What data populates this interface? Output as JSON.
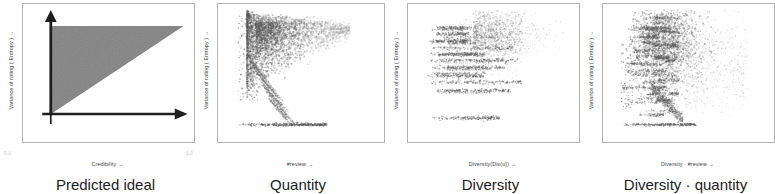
{
  "figure": {
    "shared_ylabel": "Variance of rating ( Entropy ) →",
    "background_color": "#ffffff",
    "ink_color": "#3f3f3f",
    "panel_border_color": "#b4b4b4"
  },
  "panels": [
    {
      "id": "predicted-ideal",
      "caption": "Predicted ideal",
      "ylabel": "Variance of rating ( Entropy ) →",
      "xlabel": "Credibility →",
      "xticks": [
        "0.0",
        "1.0"
      ],
      "plot_kind": "schematic-triangle",
      "fill_color": "#6b6b6b"
    },
    {
      "id": "quantity",
      "caption": "Quantity",
      "ylabel": "Variance of rating ( Entropy ) →",
      "xlabel": "#review →",
      "xticks": [],
      "plot_kind": "scatter",
      "point_color": "#5a5a5a"
    },
    {
      "id": "diversity",
      "caption": "Diversity",
      "ylabel": "Variance of rating ( Entropy ) →",
      "xlabel": "Diversity(Div(u)) →",
      "xticks": [],
      "plot_kind": "scatter",
      "point_color": "#5a5a5a"
    },
    {
      "id": "diversity-quantity",
      "caption": "Diversity · quantity",
      "ylabel": "Variance of rating ( Entropy ) →",
      "xlabel": "Diversity · #review →",
      "xticks": [],
      "plot_kind": "scatter",
      "point_color": "#5a5a5a"
    }
  ],
  "chart_data": [
    {
      "type": "area",
      "title": "Predicted ideal",
      "xlabel": "Credibility →",
      "ylabel": "Variance of rating ( Entropy ) →",
      "xlim": [
        0.0,
        1.0
      ],
      "ylim": [
        0.0,
        1.0
      ],
      "xticks": [
        0.0,
        1.0
      ],
      "grid": false,
      "legend": "none",
      "annotation": "Shaded right triangle: feasible region where entropy is highest at low credibility and shrinks linearly to zero as credibility approaches 1.0.",
      "polygon_x": [
        0.0,
        1.0,
        0.0
      ],
      "polygon_y": [
        1.0,
        1.0,
        0.0
      ],
      "fill_color": "#6b6b6b"
    },
    {
      "type": "scatter",
      "title": "Quantity",
      "xlabel": "#review →",
      "ylabel": "Variance of rating ( Entropy ) →",
      "xlim": [
        0.0,
        1.0
      ],
      "ylim": [
        0.0,
        1.0
      ],
      "grid": false,
      "legend": "none",
      "annotation": "Dense wedge-shaped cloud hugging the left edge at high entropy, thinning and fanning downward to the right; a sparse horizontal strip of zero-entropy points sits along the bottom.",
      "point_color": "#5a5a5a",
      "n_points_approx": 4000
    },
    {
      "type": "scatter",
      "title": "Diversity",
      "xlabel": "Diversity(Div(u)) →",
      "ylabel": "Variance of rating ( Entropy ) →",
      "xlim": [
        0.0,
        1.0
      ],
      "ylim": [
        0.0,
        1.0
      ],
      "grid": false,
      "legend": "none",
      "annotation": "Discrete horizontal bands of points at quantized entropy levels (roughly y = 0.10, 0.33, 0.45, 0.52, 0.60, 0.68, 0.75, 0.82) with a diffuse cloud in the upper right.",
      "point_color": "#5a5a5a",
      "band_y_levels": [
        0.1,
        0.33,
        0.4,
        0.45,
        0.52,
        0.58,
        0.63,
        0.68,
        0.74,
        0.8,
        0.85
      ],
      "n_points_approx": 3500
    },
    {
      "type": "scatter",
      "title": "Diversity · quantity",
      "xlabel": "Diversity · #review →",
      "ylabel": "Variance of rating ( Entropy ) →",
      "xlim": [
        0.0,
        1.0
      ],
      "ylim": [
        0.0,
        1.0
      ],
      "grid": false,
      "legend": "none",
      "annotation": "Combination pattern: horizontal quantized streaks on the left merge into a dense vertical cluster spanning most of the entropy range, tapering toward the bottom right.",
      "point_color": "#5a5a5a",
      "n_points_approx": 5000
    }
  ]
}
